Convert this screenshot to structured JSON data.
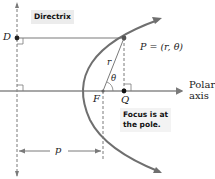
{
  "diagram": {
    "directrix_label": "Directrix",
    "point_D": "D",
    "point_P": "P = (r, θ)",
    "point_F": "F",
    "point_Q": "Q",
    "r_label": "r",
    "theta_label": "θ",
    "p_label": "p",
    "axis_label_line1": "Polar",
    "axis_label_line2": "axis",
    "focus_note_line1": "Focus is at",
    "focus_note_line2": "the pole.",
    "colors": {
      "curve": "#6f6f6f",
      "lines": "#7a7a7a",
      "points": "#222222",
      "label_bg": "#ececec"
    }
  }
}
